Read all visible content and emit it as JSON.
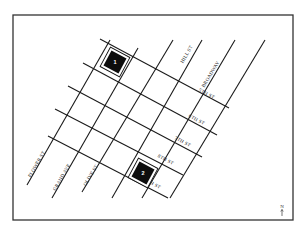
{
  "map": {
    "frame": {
      "x": 13,
      "y": 15,
      "width": 280,
      "height": 205
    },
    "avenues": [
      {
        "name": "FLOWER ST",
        "x1": 27,
        "y1": 185,
        "x2": 110,
        "y2": 40,
        "label": {
          "x": 38,
          "y": 165
        }
      },
      {
        "name": "GRAND AVE",
        "x1": 52,
        "y1": 198,
        "x2": 138,
        "y2": 48,
        "label": {
          "x": 63,
          "y": 178
        }
      },
      {
        "name": "OLIVE ST",
        "x1": 82,
        "y1": 192,
        "x2": 173,
        "y2": 40,
        "label": {
          "x": 92,
          "y": 176
        }
      },
      {
        "name": "",
        "x1": 112,
        "y1": 198,
        "x2": 202,
        "y2": 40,
        "label": null
      },
      {
        "name": "HILL ST",
        "x1": 142,
        "y1": 198,
        "x2": 235,
        "y2": 40,
        "label": {
          "x": 188,
          "y": 55
        }
      },
      {
        "name": "BROADWAY",
        "x1": 170,
        "y1": 198,
        "x2": 265,
        "y2": 40,
        "label": {
          "x": 212,
          "y": 75
        }
      }
    ],
    "streets": [
      {
        "name": "5TH ST",
        "x1": 100,
        "y1": 39,
        "x2": 229,
        "y2": 108,
        "label": {
          "x": 206,
          "y": 95
        }
      },
      {
        "name": "6TH ST",
        "x1": 83,
        "y1": 63,
        "x2": 217,
        "y2": 135,
        "label": {
          "x": 196,
          "y": 121
        }
      },
      {
        "name": "7TH ST",
        "x1": 68,
        "y1": 86,
        "x2": 202,
        "y2": 157,
        "label": {
          "x": 182,
          "y": 143
        }
      },
      {
        "name": "8TH ST",
        "x1": 55,
        "y1": 109,
        "x2": 183,
        "y2": 175,
        "label": {
          "x": 165,
          "y": 161
        }
      },
      {
        "name": "9TH ST",
        "x1": 48,
        "y1": 136,
        "x2": 168,
        "y2": 198,
        "label": {
          "x": 152,
          "y": 185
        }
      }
    ],
    "markers": [
      {
        "id": "marker-1",
        "label": "1",
        "cx": 115,
        "cy": 62
      },
      {
        "id": "marker-2",
        "label": "2",
        "cx": 143,
        "cy": 173
      }
    ],
    "north_arrow": {
      "label": "N",
      "x": 282,
      "y": 208
    }
  }
}
